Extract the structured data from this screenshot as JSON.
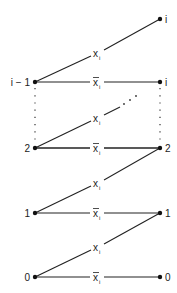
{
  "diagram": {
    "type": "state-transition-graph",
    "left_nodes": [
      {
        "label": "i − 1",
        "y": 82
      },
      {
        "label": "2",
        "y": 148
      },
      {
        "label": "1",
        "y": 213
      },
      {
        "label": "0",
        "y": 277
      }
    ],
    "right_nodes": [
      {
        "label": "i",
        "y": 19
      },
      {
        "label": "i",
        "y": 82
      },
      {
        "label": "2",
        "y": 148
      },
      {
        "label": "1",
        "y": 213
      },
      {
        "label": "0",
        "y": 277
      }
    ],
    "edges": [
      {
        "from": "i − 1",
        "to": "i (top)",
        "label_base": "x",
        "label_sub": "i",
        "negated": false
      },
      {
        "from": "i − 1",
        "to": "i",
        "label_base": "x",
        "label_sub": "i",
        "negated": true
      },
      {
        "from": "2",
        "to": "…",
        "label_base": "x",
        "label_sub": "i",
        "negated": false
      },
      {
        "from": "2",
        "to": "2",
        "label_base": "x",
        "label_sub": "i",
        "negated": true
      },
      {
        "from": "1",
        "to": "2",
        "label_base": "x",
        "label_sub": "i",
        "negated": false
      },
      {
        "from": "1",
        "to": "1",
        "label_base": "x",
        "label_sub": "i",
        "negated": true
      },
      {
        "from": "0",
        "to": "1",
        "label_base": "x",
        "label_sub": "i",
        "negated": false
      },
      {
        "from": "0",
        "to": "0",
        "label_base": "x",
        "label_sub": "i",
        "negated": true
      }
    ],
    "ellipsis": "· · ·"
  }
}
